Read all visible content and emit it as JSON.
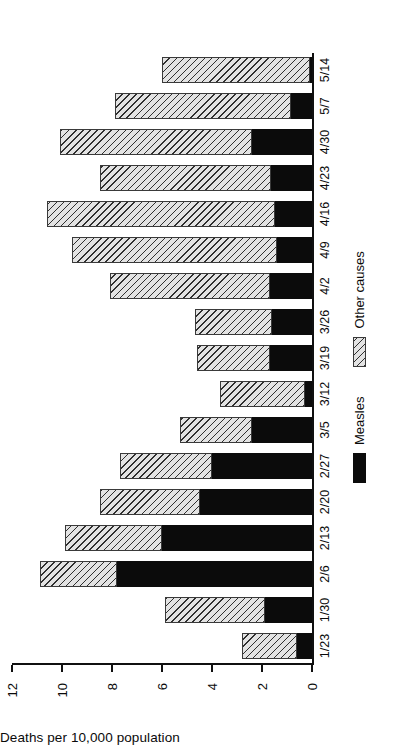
{
  "chart_data": {
    "type": "bar",
    "subtype": "stacked-bar",
    "orientation": "vertical-bars-rotated-90ccw",
    "title": "",
    "xlabel": "",
    "ylabel": "Deaths per 10,000 population",
    "ylim": [
      0,
      12
    ],
    "yticks": [
      0,
      2,
      4,
      6,
      8,
      10,
      12
    ],
    "ytick_labels": [
      "0",
      "2",
      "4",
      "6",
      "8",
      "10",
      "12"
    ],
    "grid": false,
    "legend_position": "bottom",
    "categories": [
      "1/23",
      "1/30",
      "2/6",
      "2/13",
      "2/20",
      "2/27",
      "3/5",
      "3/12",
      "3/19",
      "3/26",
      "4/2",
      "4/9",
      "4/16",
      "4/23",
      "4/30",
      "5/7",
      "5/14"
    ],
    "series": [
      {
        "name": "Measles",
        "color": "#0b0b0b",
        "pattern": "solid",
        "values": [
          0.6,
          1.9,
          7.8,
          6.0,
          4.5,
          4.0,
          2.4,
          0.3,
          1.7,
          1.6,
          1.7,
          1.4,
          1.5,
          1.65,
          2.4,
          0.85,
          0.1
        ]
      },
      {
        "name": "Other causes",
        "color": "#e3e3e3",
        "pattern": "diagonal-hatch",
        "values": [
          2.2,
          4.0,
          3.1,
          3.9,
          4.0,
          3.7,
          2.9,
          3.4,
          2.9,
          3.1,
          6.4,
          8.2,
          9.1,
          6.85,
          7.7,
          7.05,
          5.9
        ]
      }
    ],
    "totals": [
      2.8,
      5.9,
      10.9,
      9.9,
      8.5,
      7.7,
      5.3,
      3.7,
      4.6,
      4.7,
      8.1,
      9.6,
      10.6,
      8.5,
      10.1,
      7.9,
      6.0
    ]
  },
  "legend": {
    "items": [
      {
        "label": "Measles",
        "swatch": "measles"
      },
      {
        "label": "Other causes",
        "swatch": "other"
      }
    ]
  }
}
